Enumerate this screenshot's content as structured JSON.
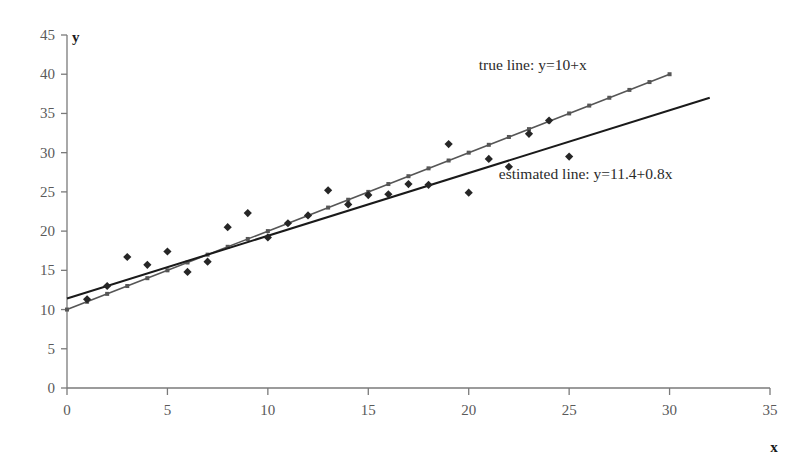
{
  "chart_data": {
    "type": "scatter",
    "title": "",
    "xlabel": "x",
    "ylabel": "y",
    "xlim": [
      0,
      35
    ],
    "ylim": [
      0,
      45
    ],
    "xticks": [
      0,
      5,
      10,
      15,
      20,
      25,
      30,
      35
    ],
    "yticks": [
      0,
      5,
      10,
      15,
      20,
      25,
      30,
      35,
      40,
      45
    ],
    "grid": false,
    "legend_position": "inline-annotations",
    "annotations": [
      {
        "name": "true-line-label",
        "text": "true line: y=10+x",
        "x": 20.5,
        "y": 40.5,
        "color": "#2b2b2b"
      },
      {
        "name": "estimated-line-label",
        "text": "estimated line: y=11.4+0.8x",
        "x": 21.5,
        "y": 26.6,
        "color": "#2b2b2b"
      }
    ],
    "series": [
      {
        "name": "observations",
        "type": "scatter",
        "marker": "diamond",
        "color": "#262626",
        "points": [
          [
            1,
            11.3
          ],
          [
            2,
            13.0
          ],
          [
            3,
            16.7
          ],
          [
            4,
            15.7
          ],
          [
            5,
            17.4
          ],
          [
            6,
            14.8
          ],
          [
            7,
            16.1
          ],
          [
            8,
            20.5
          ],
          [
            9,
            22.3
          ],
          [
            10,
            19.2
          ],
          [
            11,
            21.0
          ],
          [
            12,
            22.0
          ],
          [
            13,
            25.2
          ],
          [
            14,
            23.4
          ],
          [
            15,
            24.6
          ],
          [
            16,
            24.7
          ],
          [
            17,
            26.0
          ],
          [
            18,
            25.9
          ],
          [
            19,
            31.1
          ],
          [
            20,
            24.9
          ],
          [
            21,
            29.2
          ],
          [
            22,
            28.2
          ],
          [
            23,
            32.4
          ],
          [
            24,
            34.1
          ],
          [
            25,
            29.5
          ]
        ]
      },
      {
        "name": "true line",
        "type": "line",
        "equation": "y=10+x",
        "slope": 1,
        "intercept": 10,
        "color": "#565656",
        "marker": "small-square",
        "x_start": 0,
        "x_end": 30,
        "y_start": 10,
        "y_end": 40
      },
      {
        "name": "estimated line",
        "type": "line",
        "equation": "y=11.4+0.8x",
        "slope": 0.8,
        "intercept": 11.4,
        "color": "#1a1a1a",
        "marker": "none",
        "x_start": 0,
        "x_end": 32,
        "y_start": 11.4,
        "y_end": 37.0
      }
    ]
  },
  "axes": {
    "x_axis_name": "x-axis",
    "y_axis_name": "y-axis",
    "axis_color": "#7a7a7a"
  }
}
